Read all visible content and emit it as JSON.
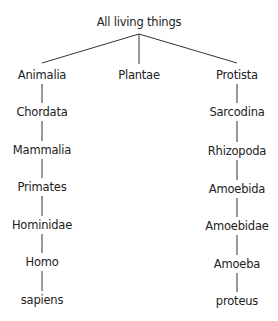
{
  "root": "All living things",
  "branches": [
    {
      "name": "left",
      "nodes": [
        "Animalia",
        "Chordata",
        "Mammalia",
        "Primates",
        "Hominidae",
        "Homo",
        "sapiens"
      ]
    },
    {
      "name": "middle",
      "nodes": [
        "Plantae"
      ]
    },
    {
      "name": "right",
      "nodes": [
        "Protista",
        "Sarcodina",
        "Rhizopoda",
        "Amoebida",
        "Amoebidae",
        "Amoeba",
        "proteus"
      ]
    }
  ]
}
